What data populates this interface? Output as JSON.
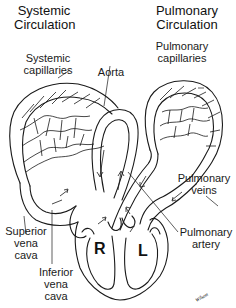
{
  "diagram": {
    "titles": {
      "left": [
        "Systemic",
        "Circulation"
      ],
      "right": [
        "Pulmonary",
        "Circulation"
      ]
    },
    "labels": {
      "systemic_capillaries": [
        "Systemic",
        "capillaries"
      ],
      "pulmonary_capillaries": [
        "Pulmonary",
        "capillaries"
      ],
      "aorta": "Aorta",
      "pulmonary_veins": [
        "Pulmonary",
        "veins"
      ],
      "superior_vena_cava": [
        "Superior",
        "vena",
        "cava"
      ],
      "pulmonary_artery": [
        "Pulmonary",
        "artery"
      ],
      "inferior_vena_cava": [
        "Inferior",
        "vena",
        "cava"
      ]
    },
    "chambers": {
      "right": "R",
      "left": "L"
    },
    "signature": "Wilson"
  }
}
